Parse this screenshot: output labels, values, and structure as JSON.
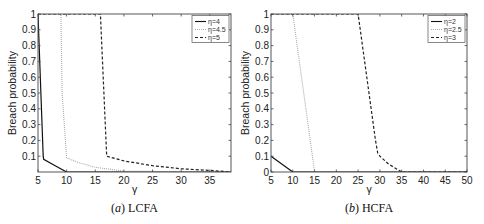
{
  "chart_data": [
    {
      "type": "line",
      "caption_prefix": "(a)",
      "caption": "LCFA",
      "xlabel": "γ",
      "ylabel": "Breach probability",
      "xlim": [
        5,
        38.7
      ],
      "ylim": [
        0,
        1
      ],
      "xticks": [
        5,
        10,
        15,
        20,
        25,
        30,
        35
      ],
      "yticks": [
        0.1,
        0.2,
        0.3,
        0.4,
        0.5,
        0.6,
        0.7,
        0.8,
        0.9,
        1
      ],
      "ytick_labels": [
        "0.1",
        "0.2",
        "0.3",
        "0.4",
        "0.5",
        "0.6",
        "0.7",
        "0.8",
        "0.9",
        "1"
      ],
      "grid": false,
      "legend_position": "upper right",
      "series": [
        {
          "name": "η=4",
          "style": "solid",
          "color": "#111111",
          "x": [
            5,
            5.9,
            6.0,
            8.0,
            10.0,
            38.7
          ],
          "y": [
            1.0,
            0.1,
            0.08,
            0.04,
            0.0,
            0.0
          ]
        },
        {
          "name": "η=4.5",
          "style": "dotted",
          "color": "#aaaaaa",
          "x": [
            5,
            9.0,
            9.2,
            10.0,
            12.0,
            15.0,
            18.0,
            20.0,
            38.7
          ],
          "y": [
            1.0,
            1.0,
            0.5,
            0.09,
            0.06,
            0.03,
            0.015,
            0.005,
            0.0
          ]
        },
        {
          "name": "η=5",
          "style": "dashdot",
          "color": "#222222",
          "x": [
            5,
            15.9,
            16.5,
            17.0,
            20.0,
            25.0,
            30.0,
            35.0,
            38.7
          ],
          "y": [
            1.0,
            1.0,
            0.5,
            0.1,
            0.07,
            0.04,
            0.02,
            0.01,
            0.0
          ]
        }
      ]
    },
    {
      "type": "line",
      "caption_prefix": "(b)",
      "caption": "HCFA",
      "xlabel": "γ",
      "ylabel": "Breach probability",
      "xlim": [
        5,
        50
      ],
      "ylim": [
        0,
        1
      ],
      "xticks": [
        5,
        10,
        15,
        20,
        25,
        30,
        35,
        40,
        45,
        50
      ],
      "yticks": [
        0,
        0.1,
        0.2,
        0.3,
        0.4,
        0.5,
        0.6,
        0.7,
        0.8,
        0.9,
        1
      ],
      "ytick_labels": [
        "0",
        "0.1",
        "0.2",
        "0.3",
        "0.4",
        "0.5",
        "0.6",
        "0.7",
        "0.8",
        "0.9",
        "1"
      ],
      "grid": false,
      "legend_position": "upper right",
      "series": [
        {
          "name": "η=2",
          "style": "solid",
          "color": "#111111",
          "x": [
            5,
            10,
            50
          ],
          "y": [
            0.1,
            0.0,
            0.0
          ]
        },
        {
          "name": "η=2.5",
          "style": "dotted",
          "color": "#aaaaaa",
          "x": [
            5,
            10,
            15,
            50
          ],
          "y": [
            1.0,
            1.0,
            0.0,
            0.0
          ]
        },
        {
          "name": "η=3",
          "style": "dashdot",
          "color": "#222222",
          "x": [
            5,
            25,
            27,
            29,
            29.5,
            30,
            32,
            35,
            50
          ],
          "y": [
            1.0,
            1.0,
            0.6,
            0.2,
            0.12,
            0.1,
            0.05,
            0.0,
            0.0
          ]
        }
      ]
    }
  ],
  "panels": [
    {
      "box": [
        38,
        14,
        231,
        172
      ]
    },
    {
      "box": [
        271,
        14,
        467,
        172
      ]
    }
  ]
}
